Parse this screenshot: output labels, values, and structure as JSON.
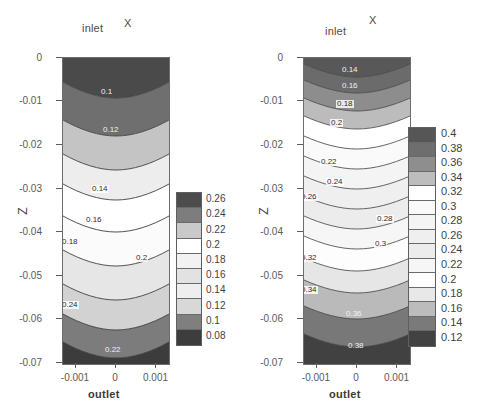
{
  "figure": {
    "panels": [
      {
        "id": "left",
        "title_inlet": "inlet",
        "title_outlet": "outlet",
        "x_axis_name": "X",
        "y_axis_name": "Z",
        "xticks": [
          "-0.001",
          "0",
          "0.001"
        ],
        "yticks": [
          "0",
          "-0.01",
          "-0.02",
          "-0.03",
          "-0.04",
          "-0.05",
          "-0.06",
          "-0.07"
        ],
        "colorbar_labels": [
          "0.26",
          "0.24",
          "0.22",
          "0.2",
          "0.18",
          "0.16",
          "0.14",
          "0.12",
          "0.1",
          "0.08"
        ],
        "colorbar_colors": [
          "#4c4c4c",
          "#7d7d7d",
          "#c9c9c9",
          "#ffffff",
          "#f2f2f2",
          "#e2e2e2",
          "#eeeeee",
          "#d8d8d8",
          "#7f7f7f",
          "#3d3d3d"
        ],
        "contour_labels": [
          "0.1",
          "0.12",
          "0.14",
          "0.16",
          "0.18",
          "0.2",
          "0.24",
          "0.22"
        ]
      },
      {
        "id": "right",
        "title_inlet": "inlet",
        "title_outlet": "outlet",
        "x_axis_name": "X",
        "y_axis_name": "Z",
        "xticks": [
          "-0.001",
          "0",
          "0.001"
        ],
        "yticks": [
          "0",
          "-0.01",
          "-0.02",
          "-0.03",
          "-0.04",
          "-0.05",
          "-0.06",
          "-0.07"
        ],
        "colorbar_labels": [
          "0.4",
          "0.38",
          "0.36",
          "0.34",
          "0.32",
          "0.3",
          "0.28",
          "0.26",
          "0.24",
          "0.22",
          "0.2",
          "0.18",
          "0.16",
          "0.14",
          "0.12"
        ],
        "colorbar_colors": [
          "#565656",
          "#6e6e6e",
          "#8e8e8e",
          "#bdbdbd",
          "#ffffff",
          "#fafafa",
          "#f4f4f4",
          "#efefef",
          "#ececec",
          "#f6f6f6",
          "#fdfdfd",
          "#e8e8e8",
          "#bcbcbc",
          "#7a7a7a",
          "#424242"
        ],
        "contour_labels": [
          "0.14",
          "0.16",
          "0.18",
          "0.2",
          "0.22",
          "0.24",
          "0.26",
          "0.28",
          "0.3",
          "0.32",
          "0.34",
          "0.36",
          "0.38"
        ]
      }
    ]
  },
  "chart_data": {
    "type": "contour",
    "n_panels": 2,
    "shared": {
      "xlabel": "X",
      "ylabel": "Z",
      "top_boundary_label": "inlet",
      "bottom_boundary_label": "outlet",
      "xlim": [
        -0.0013,
        0.0013
      ],
      "ylim": [
        -0.07,
        0.0
      ],
      "xticks": [
        -0.001,
        0,
        0.001
      ],
      "yticks": [
        0,
        -0.01,
        -0.02,
        -0.03,
        -0.04,
        -0.05,
        -0.06,
        -0.07
      ],
      "grid": false,
      "colormap": "grayscale",
      "legend_position": "right-of-axes"
    },
    "panels": [
      {
        "name": "left",
        "title": "inlet / X",
        "contour_levels": [
          0.08,
          0.1,
          0.12,
          0.14,
          0.16,
          0.18,
          0.2,
          0.22,
          0.24,
          0.26
        ],
        "level_step": 0.02,
        "vmin": 0.08,
        "vmax": 0.26,
        "colorbar_ticks": [
          0.26,
          0.24,
          0.22,
          0.2,
          0.18,
          0.16,
          0.14,
          0.12,
          0.1,
          0.08
        ],
        "band_fill_colors": [
          "#4c4c4c",
          "#7d7d7d",
          "#c9c9c9",
          "#ffffff",
          "#f2f2f2",
          "#e2e2e2",
          "#eeeeee",
          "#d8d8d8",
          "#7f7f7f",
          "#3d3d3d"
        ],
        "description": "Horizontal wavy bands; darkest at top (inlet) and bottom (outlet), lightest near mid-depth. Contours dip downward near x=0.",
        "labelled_contours_in_field": [
          "0.1",
          "0.12",
          "0.14",
          "0.16",
          "0.18",
          "0.2",
          "0.22",
          "0.24"
        ],
        "contour_depth_at_x0": [
          {
            "level": 0.1,
            "z": -0.004
          },
          {
            "level": 0.12,
            "z": -0.015
          },
          {
            "level": 0.14,
            "z": -0.029
          },
          {
            "level": 0.16,
            "z": -0.037
          },
          {
            "level": 0.18,
            "z": -0.0405
          },
          {
            "level": 0.2,
            "z": -0.0475
          },
          {
            "level": 0.22,
            "z": -0.0555
          },
          {
            "level": 0.24,
            "z": -0.0615
          },
          {
            "level": 0.26,
            "z": -0.0675
          }
        ]
      },
      {
        "name": "right",
        "title": "inlet / X",
        "contour_levels": [
          0.12,
          0.14,
          0.16,
          0.18,
          0.2,
          0.22,
          0.24,
          0.26,
          0.28,
          0.3,
          0.32,
          0.34,
          0.36,
          0.38,
          0.4
        ],
        "level_step": 0.02,
        "vmin": 0.12,
        "vmax": 0.4,
        "colorbar_ticks": [
          0.4,
          0.38,
          0.36,
          0.34,
          0.32,
          0.3,
          0.28,
          0.26,
          0.24,
          0.22,
          0.2,
          0.18,
          0.16,
          0.14,
          0.12
        ],
        "band_fill_colors": [
          "#565656",
          "#6e6e6e",
          "#8e8e8e",
          "#bdbdbd",
          "#ffffff",
          "#fafafa",
          "#f4f4f4",
          "#efefef",
          "#ececec",
          "#f6f6f6",
          "#fdfdfd",
          "#e8e8e8",
          "#bcbcbc",
          "#7a7a7a",
          "#424242"
        ],
        "description": "Same geometry as left panel but with a wider value range and more densely packed contours; dark bands at top and bottom, light bands through the middle.",
        "labelled_contours_in_field": [
          "0.14",
          "0.16",
          "0.18",
          "0.2",
          "0.22",
          "0.24",
          "0.26",
          "0.28",
          "0.3",
          "0.32",
          "0.34",
          "0.36",
          "0.38"
        ],
        "contour_depth_at_x0": [
          {
            "level": 0.14,
            "z": -0.0025
          },
          {
            "level": 0.16,
            "z": -0.006
          },
          {
            "level": 0.18,
            "z": -0.0095
          },
          {
            "level": 0.2,
            "z": -0.0135
          },
          {
            "level": 0.22,
            "z": -0.018
          },
          {
            "level": 0.24,
            "z": -0.0225
          },
          {
            "level": 0.26,
            "z": -0.0265
          },
          {
            "level": 0.28,
            "z": -0.031
          },
          {
            "level": 0.3,
            "z": -0.0355
          },
          {
            "level": 0.32,
            "z": -0.0405
          },
          {
            "level": 0.34,
            "z": -0.045
          },
          {
            "level": 0.36,
            "z": -0.0505
          },
          {
            "level": 0.38,
            "z": -0.058
          },
          {
            "level": 0.4,
            "z": -0.066
          }
        ]
      }
    ]
  }
}
